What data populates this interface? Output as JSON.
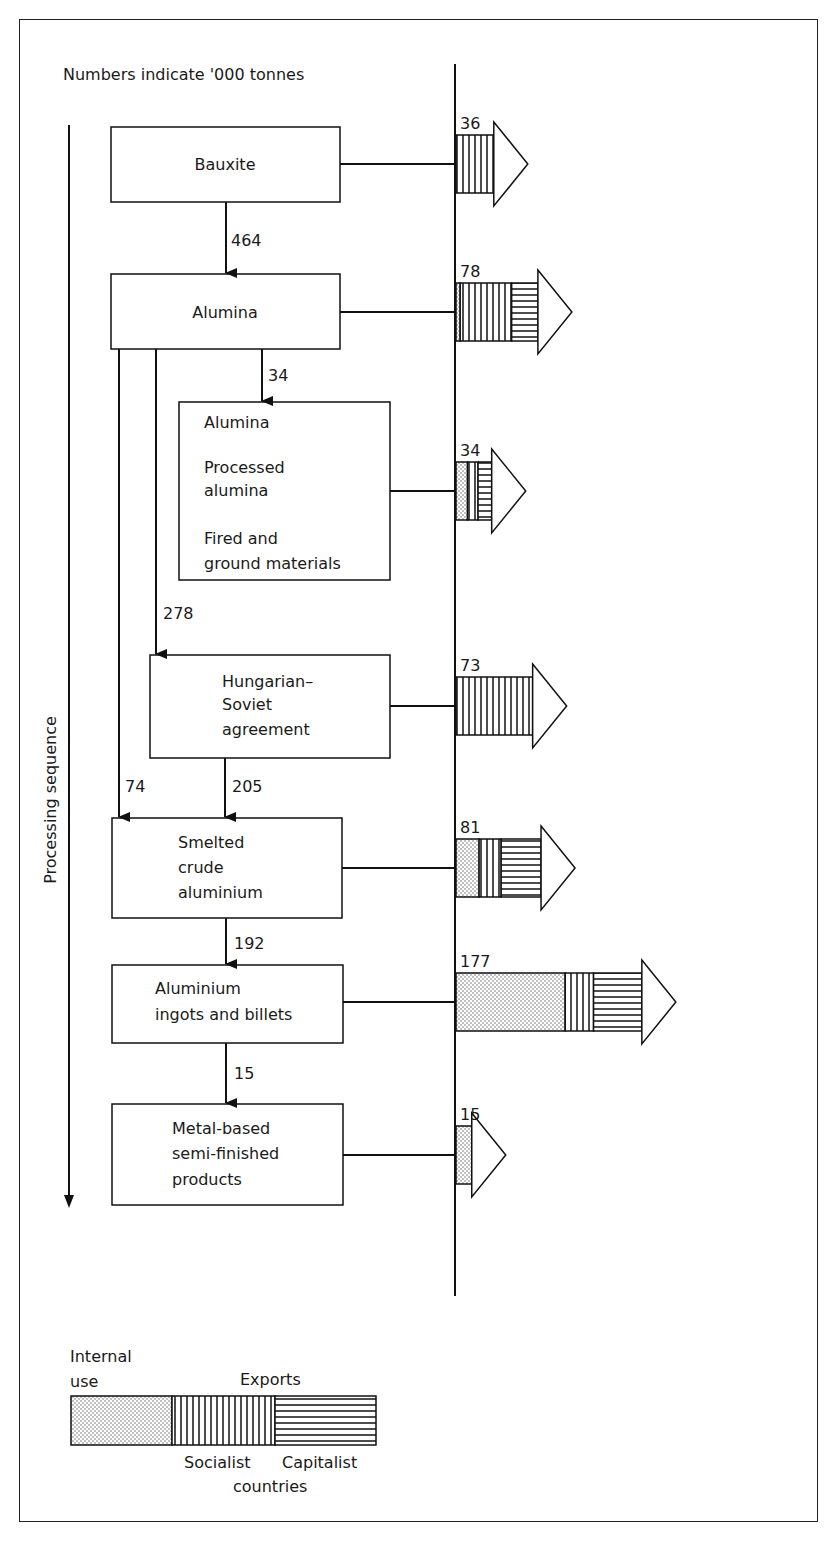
{
  "title": "Numbers indicate '000 tonnes",
  "axis_label": "Processing sequence",
  "stages": [
    {
      "id": "bauxite",
      "lines": [
        "Bauxite"
      ],
      "export_total": "36",
      "segments": {
        "internal": 0,
        "socialist": 36,
        "capitalist": 0
      }
    },
    {
      "id": "alumina",
      "lines": [
        "Alumina"
      ],
      "export_total": "78",
      "segments": {
        "internal": 4,
        "socialist": 49,
        "capitalist": 25
      }
    },
    {
      "id": "alumina-products",
      "lines": [
        "Alumina",
        "",
        "Processed",
        "alumina",
        "",
        "Fired and",
        "ground materials"
      ],
      "export_total": "34",
      "segments": {
        "internal": 11,
        "socialist": 10,
        "capitalist": 13
      }
    },
    {
      "id": "hungarian-soviet",
      "lines": [
        "Hungarian–",
        "Soviet",
        "agreement"
      ],
      "export_total": "73",
      "segments": {
        "internal": 0,
        "socialist": 73,
        "capitalist": 0
      }
    },
    {
      "id": "smelted",
      "lines": [
        "Smelted",
        "crude",
        "aluminium"
      ],
      "export_total": "81",
      "segments": {
        "internal": 22,
        "socialist": 21,
        "capitalist": 38
      }
    },
    {
      "id": "ingots",
      "lines": [
        "Aluminium",
        "ingots and billets"
      ],
      "export_total": "177",
      "segments": {
        "internal": 104,
        "socialist": 27,
        "capitalist": 46
      }
    },
    {
      "id": "semi-finished",
      "lines": [
        "Metal-based",
        "semi-finished",
        "products"
      ],
      "export_total": "15",
      "segments": {
        "internal": 15,
        "socialist": 0,
        "capitalist": 0
      }
    }
  ],
  "flows": [
    {
      "from": "bauxite",
      "to": "alumina",
      "value": "464"
    },
    {
      "from": "alumina",
      "to": "alumina-products",
      "value": "34"
    },
    {
      "from": "alumina",
      "to": "hungarian-soviet",
      "value": "278"
    },
    {
      "from": "alumina",
      "to": "smelted",
      "value": "74"
    },
    {
      "from": "hungarian-soviet",
      "to": "smelted",
      "value": "205"
    },
    {
      "from": "smelted",
      "to": "ingots",
      "value": "192"
    },
    {
      "from": "ingots",
      "to": "semi-finished",
      "value": "15"
    }
  ],
  "legend": {
    "internal_label_1": "Internal",
    "internal_label_2": "use",
    "exports_label": "Exports",
    "socialist_label": "Socialist",
    "capitalist_label": "Capitalist",
    "countries_label": "countries"
  },
  "chart_data": {
    "type": "diagram",
    "title": "Numbers indicate '000 tonnes",
    "units": "'000 tonnes",
    "export_arrows": [
      {
        "stage": "Bauxite",
        "total": 36
      },
      {
        "stage": "Alumina",
        "total": 78
      },
      {
        "stage": "Alumina / Processed alumina / Fired and ground materials",
        "total": 34
      },
      {
        "stage": "Hungarian–Soviet agreement",
        "total": 73
      },
      {
        "stage": "Smelted crude aluminium",
        "total": 81
      },
      {
        "stage": "Aluminium ingots and billets",
        "total": 177
      },
      {
        "stage": "Metal-based semi-finished products",
        "total": 15
      }
    ],
    "flows": [
      {
        "from": "Bauxite",
        "to": "Alumina",
        "value": 464
      },
      {
        "from": "Alumina",
        "to": "Alumina products",
        "value": 34
      },
      {
        "from": "Alumina",
        "to": "Hungarian–Soviet agreement",
        "value": 278
      },
      {
        "from": "Alumina",
        "to": "Smelted crude aluminium",
        "value": 74
      },
      {
        "from": "Hungarian–Soviet agreement",
        "to": "Smelted crude aluminium",
        "value": 205
      },
      {
        "from": "Smelted crude aluminium",
        "to": "Aluminium ingots and billets",
        "value": 192
      },
      {
        "from": "Aluminium ingots and billets",
        "to": "Metal-based semi-finished products",
        "value": 15
      }
    ],
    "legend": [
      "Internal use",
      "Exports: Socialist countries",
      "Exports: Capitalist countries"
    ]
  }
}
